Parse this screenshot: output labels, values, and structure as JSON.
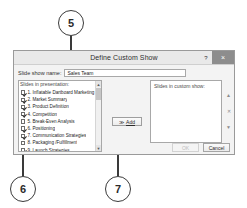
{
  "callouts": [
    {
      "number": "5"
    },
    {
      "number": "6"
    },
    {
      "number": "7"
    }
  ],
  "dialog": {
    "title": "Define Custom Show",
    "help_label": "?",
    "close_label": "×",
    "name_field": {
      "label": "Slide show name:",
      "value": "Sales Team",
      "placeholder": "Custom Show 1"
    },
    "left_list": {
      "caption": "Slides in presentation:",
      "items": [
        {
          "number": "1.",
          "label": "1. Inflatable Dartboard Marketing Plan",
          "checked": true
        },
        {
          "number": "2.",
          "label": "2. Market Summary",
          "checked": true
        },
        {
          "number": "3.",
          "label": "3. Product Definition",
          "checked": true
        },
        {
          "number": "4.",
          "label": "4. Competition",
          "checked": true
        },
        {
          "number": "5.",
          "label": "5. Break-Even Analysis",
          "checked": false
        },
        {
          "number": "6.",
          "label": "6. Positioning",
          "checked": true
        },
        {
          "number": "7.",
          "label": "7. Communication Strategies",
          "checked": true
        },
        {
          "number": "8.",
          "label": "8. Packaging /Fulfillment",
          "checked": false
        },
        {
          "number": "9.",
          "label": "9. Launch Strategies",
          "checked": true
        },
        {
          "number": "10.",
          "label": "10. Public Relations",
          "checked": true
        }
      ],
      "scroll_up_icon": "▲",
      "scroll_down_icon": "▼"
    },
    "add_button": {
      "label": "Add",
      "arrow_icon": "≫"
    },
    "right_list": {
      "caption": "Slides in custom show:",
      "items": []
    },
    "reorder_buttons": [
      {
        "name": "move-up",
        "icon": "▲"
      },
      {
        "name": "remove",
        "icon": "✕"
      },
      {
        "name": "move-down",
        "icon": "▼"
      }
    ],
    "footer": {
      "ok_label": "OK",
      "cancel_label": "Cancel"
    }
  }
}
